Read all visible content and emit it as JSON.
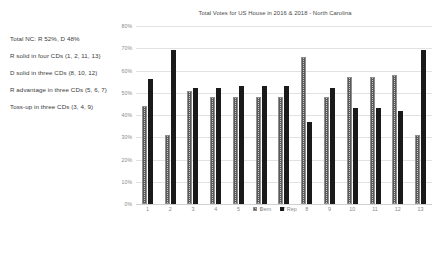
{
  "notes": [
    "Total NC: R 52%, D 48%",
    "R solid in four CDs (1, 2, 11, 13)",
    "D solid in three CDs (8, 10, 12)",
    "R advantage in three CDs (5, 6, 7)",
    "Toss-up in three CDs (3, 4, 9)"
  ],
  "chart_data": {
    "type": "bar",
    "title": "Total Votes for US House in 2016 & 2018 - North Carolina",
    "xlabel": "",
    "ylabel": "",
    "categories": [
      "1",
      "2",
      "3",
      "4",
      "5",
      "6",
      "7",
      "8",
      "9",
      "10",
      "11",
      "12",
      "13"
    ],
    "series": [
      {
        "name": "Dem",
        "values": [
          44,
          31,
          51,
          48,
          48,
          48,
          48,
          66,
          48,
          57,
          57,
          58,
          31
        ]
      },
      {
        "name": "Rep",
        "values": [
          56,
          69,
          52,
          52,
          53,
          53,
          53,
          37,
          52,
          43,
          43,
          42,
          69
        ]
      }
    ],
    "ylim": [
      0,
      80
    ],
    "yticks": [
      "0%",
      "10%",
      "20%",
      "30%",
      "40%",
      "50%",
      "60%",
      "70%",
      "80%"
    ],
    "ytick_values": [
      0,
      10,
      20,
      30,
      40,
      50,
      60,
      70,
      80
    ],
    "grid": true,
    "legend_position": "bottom",
    "colors": {
      "dem": "#c9c9c9",
      "rep": "#1a1a1a",
      "grid": "#e2e2e2",
      "text": "#8a8a8a"
    }
  }
}
